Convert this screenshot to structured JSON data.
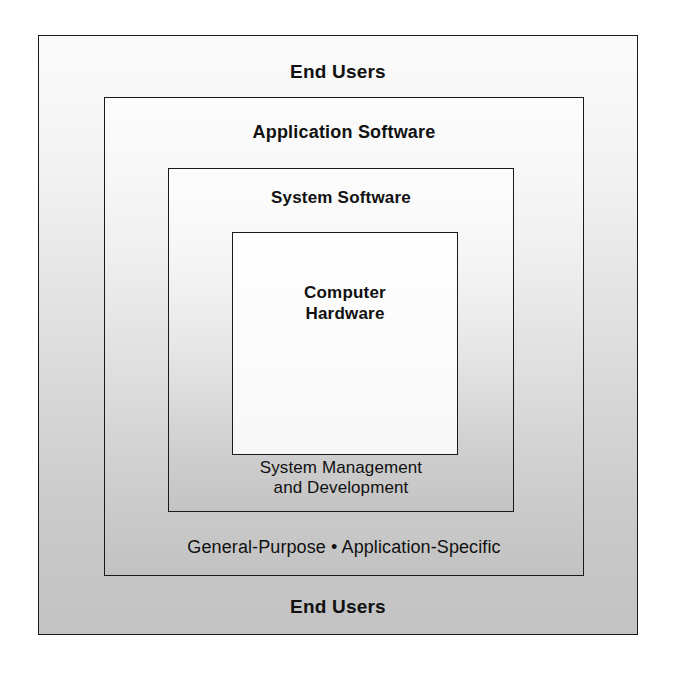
{
  "diagram": {
    "type": "nested-layers",
    "layers": [
      {
        "id": "end-users",
        "name": "End Users",
        "top_label": "End Users",
        "bottom_label": "End Users",
        "fill_top": "#fbfbfb",
        "fill_bottom": "#c3c3c3",
        "border_color": "#1a1a1a"
      },
      {
        "id": "application-software",
        "name": "Application Software",
        "top_label": "Application Software",
        "bottom_label": "General-Purpose • Application-Specific",
        "fill_top": "#fcfcfc",
        "fill_bottom": "#c2c2c2",
        "border_color": "#1a1a1a"
      },
      {
        "id": "system-software",
        "name": "System Software",
        "top_label": "System Software",
        "bottom_label": "System Management\nand Development",
        "fill_top": "#fdfdfd",
        "fill_bottom": "#c4c4c4",
        "border_color": "#1a1a1a"
      },
      {
        "id": "computer-hardware",
        "name": "Computer Hardware",
        "center_label": "Computer\nHardware",
        "fill_top": "#fefefe",
        "fill_bottom": "#f7f7f7",
        "border_color": "#1a1a1a"
      }
    ]
  }
}
